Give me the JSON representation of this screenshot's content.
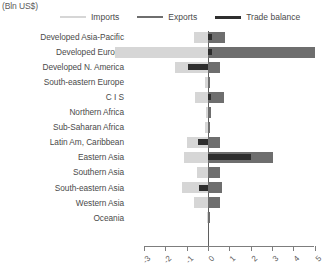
{
  "header": {
    "unit_title": "(Bln US$)"
  },
  "legend": {
    "position": "top",
    "items": [
      {
        "label": "Imports",
        "color": "#d6d6d6",
        "icon": "line-swatch-icon"
      },
      {
        "label": "Exports",
        "color": "#6e6e6e",
        "icon": "line-swatch-icon"
      },
      {
        "label": "Trade balance",
        "color": "#2e2e2e",
        "icon": "line-swatch-icon"
      }
    ]
  },
  "chart_data": {
    "type": "bar",
    "orientation": "horizontal",
    "title": "(Bln US$)",
    "xlabel": "",
    "ylabel": "",
    "xlim": [
      -3,
      5
    ],
    "xticks": [
      -3,
      -2,
      -1,
      0,
      1,
      2,
      3,
      4,
      5
    ],
    "xtick_labels": [
      "-3",
      "-2",
      "-1",
      "0",
      "1",
      "2",
      "3",
      "4",
      "5"
    ],
    "grid": false,
    "legend_position": "top",
    "categories": [
      "Developed Asia-Pacific",
      "Developed Europe",
      "Developed N. America",
      "South-eastern Europe",
      "C I S",
      "Northern Africa",
      "Sub-Saharan Africa",
      "Latin Am, Caribbean",
      "Eastern Asia",
      "Southern Asia",
      "South-eastern Asia",
      "Western Asia",
      "Oceania"
    ],
    "series": [
      {
        "name": "Imports",
        "color": "#d6d6d6",
        "values": [
          -0.65,
          -4.35,
          -1.55,
          -0.12,
          -0.6,
          -0.1,
          -0.15,
          -1.0,
          -1.15,
          -0.5,
          -1.2,
          -0.65,
          -0.05
        ]
      },
      {
        "name": "Exports",
        "color": "#6e6e6e",
        "values": [
          0.8,
          5.0,
          0.55,
          0.1,
          0.75,
          0.12,
          0.1,
          0.55,
          3.05,
          0.55,
          0.65,
          0.55,
          0.05
        ]
      },
      {
        "name": "Trade balance",
        "color": "#2e2e2e",
        "values": [
          0.18,
          0.2,
          -0.95,
          0.0,
          0.15,
          0.0,
          0.0,
          -0.45,
          2.0,
          0.0,
          -0.4,
          0.0,
          0.0
        ]
      }
    ]
  },
  "axis": {
    "tick_labels": [
      "-3",
      "-2",
      "-1",
      "0",
      "1",
      "2",
      "3",
      "4",
      "5"
    ]
  }
}
